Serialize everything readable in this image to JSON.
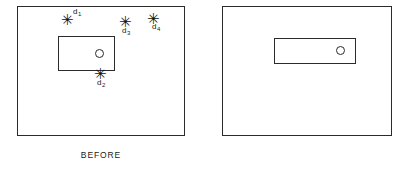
{
  "figure": {
    "type": "before-after-diagram",
    "background_color": "#ffffff",
    "line_color": "#2b2b2b"
  },
  "panels": [
    {
      "id": "before",
      "caption": "BEFORE",
      "frame": {
        "x": 17,
        "y": 6,
        "width": 168,
        "height": 130
      },
      "inner_rect": {
        "x": 40,
        "y": 29,
        "width": 57,
        "height": 35
      },
      "circle": {
        "x": 77,
        "y": 42,
        "diameter": 9
      },
      "defects": [
        {
          "id": "d1",
          "marker": "✳",
          "label_text": "d",
          "label_subscript": "1",
          "marker_x": 66,
          "marker_y": 19,
          "label_position": "upper-right"
        },
        {
          "id": "d3",
          "marker": "✳",
          "label_text": "d",
          "label_subscript": "3",
          "marker_x": 124,
          "marker_y": 21,
          "label_position": "below"
        },
        {
          "id": "d4",
          "marker": "✳",
          "label_text": "d",
          "label_subscript": "4",
          "marker_x": 152,
          "marker_y": 18,
          "label_position": "below-right"
        },
        {
          "id": "d2",
          "marker": "✳",
          "label_text": "d",
          "label_subscript": "2",
          "marker_x": 99,
          "marker_y": 73,
          "label_position": "below"
        }
      ]
    },
    {
      "id": "after",
      "caption": "AFTER",
      "frame": {
        "x": 222,
        "y": 6,
        "width": 170,
        "height": 130
      },
      "inner_rect": {
        "x": 255,
        "y": 31,
        "width": 82,
        "height": 26
      },
      "circle": {
        "x": 317,
        "y": 39,
        "diameter": 9
      },
      "defects": []
    }
  ]
}
